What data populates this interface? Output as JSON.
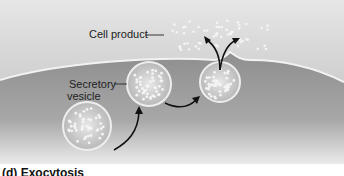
{
  "figure": {
    "labels": {
      "cell_product": "Cell product",
      "secretory_vesicle_line1": "Secretory",
      "secretory_vesicle_line2": "vesicle"
    },
    "caption": "(d) Exocytosis"
  }
}
